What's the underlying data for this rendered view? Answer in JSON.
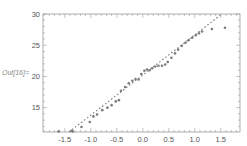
{
  "cell": {
    "output_label": "Out[16]="
  },
  "chart_data": {
    "type": "scatter",
    "title": "",
    "xlabel": "",
    "ylabel": "",
    "xlim": [
      -1.92,
      1.87
    ],
    "ylim": [
      11.1,
      30
    ],
    "grid": false,
    "frame": true,
    "x_ticks": [
      -1.5,
      -1.0,
      -0.5,
      0.0,
      0.5,
      1.0,
      1.5
    ],
    "x_tick_labels": [
      "-1.5",
      "-1.0",
      "-0.5",
      "0.0",
      "0.5",
      "1.0",
      "1.5"
    ],
    "y_ticks": [
      15,
      20,
      25,
      30
    ],
    "y_tick_labels": [
      "15",
      "20",
      "25",
      "30"
    ],
    "series": [
      {
        "name": "data",
        "style": "points",
        "color": "#7a7a7a",
        "points": [
          [
            -1.62,
            11.2
          ],
          [
            -1.37,
            11.3
          ],
          [
            -1.35,
            11.2
          ],
          [
            -1.18,
            11.9
          ],
          [
            -1.02,
            12.7
          ],
          [
            -0.95,
            13.6
          ],
          [
            -0.88,
            13.9
          ],
          [
            -0.78,
            14.6
          ],
          [
            -0.68,
            15.0
          ],
          [
            -0.6,
            15.4
          ],
          [
            -0.52,
            16.0
          ],
          [
            -0.46,
            16.2
          ],
          [
            -0.42,
            17.7
          ],
          [
            -0.34,
            18.3
          ],
          [
            -0.27,
            18.9
          ],
          [
            -0.2,
            19.3
          ],
          [
            -0.14,
            19.6
          ],
          [
            -0.08,
            19.5
          ],
          [
            -0.03,
            20.4
          ],
          [
            0.03,
            20.9
          ],
          [
            0.08,
            21.1
          ],
          [
            0.13,
            21.0
          ],
          [
            0.18,
            21.3
          ],
          [
            0.24,
            21.6
          ],
          [
            0.3,
            21.7
          ],
          [
            0.37,
            21.7
          ],
          [
            0.43,
            21.9
          ],
          [
            0.48,
            22.3
          ],
          [
            0.55,
            23.0
          ],
          [
            0.62,
            23.7
          ],
          [
            0.68,
            24.3
          ],
          [
            0.75,
            24.9
          ],
          [
            0.82,
            25.4
          ],
          [
            0.88,
            25.8
          ],
          [
            0.95,
            26.2
          ],
          [
            1.02,
            26.6
          ],
          [
            1.08,
            26.9
          ],
          [
            1.14,
            27.2
          ],
          [
            1.33,
            27.6
          ],
          [
            1.58,
            27.8
          ]
        ]
      },
      {
        "name": "reference line",
        "style": "dashed",
        "color": "#7a7a7a",
        "points": [
          [
            -1.42,
            11.1
          ],
          [
            1.52,
            30.0
          ]
        ]
      }
    ]
  }
}
